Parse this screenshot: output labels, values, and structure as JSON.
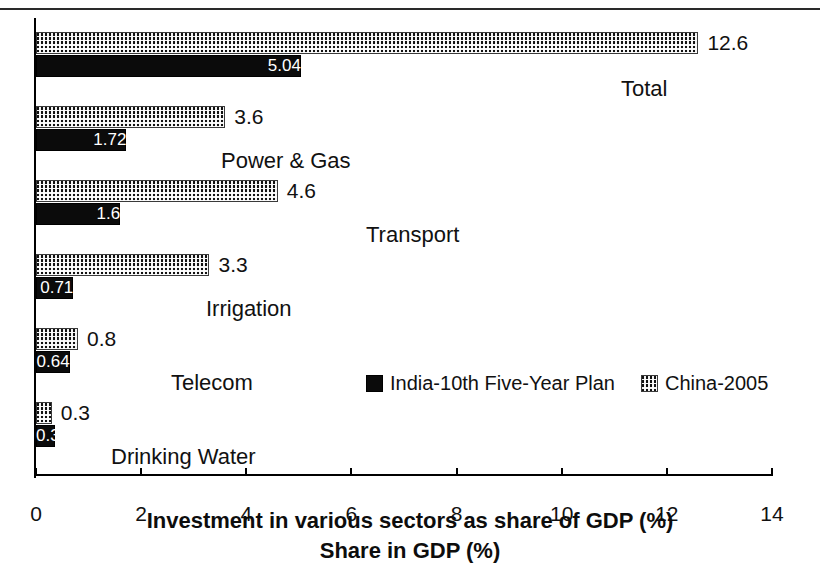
{
  "chart_data": {
    "type": "bar",
    "orientation": "horizontal",
    "title": "",
    "xlabel": "Investment in various sectors as share of GDP (%)",
    "xlabel_secondary": "Share in GDP (%)",
    "ylabel": "",
    "xlim": [
      0,
      14
    ],
    "xticks": [
      0,
      2,
      4,
      6,
      8,
      10,
      12,
      14
    ],
    "xtick_labels": [
      "0",
      "2",
      "4",
      "6",
      "8",
      "10",
      "12",
      "14"
    ],
    "grid": false,
    "legend_position": "inside-middle-right",
    "categories": [
      "Total",
      "Power & Gas",
      "Transport",
      "Irrigation",
      "Telecom",
      "Drinking Water"
    ],
    "series": [
      {
        "name": "India-10th Five-Year Plan",
        "fill": "solid-black",
        "color": "#0b0b0b",
        "values": [
          5.04,
          1.72,
          1.6,
          0.71,
          0.64,
          0.37
        ],
        "value_labels": [
          "5.04",
          "1.72",
          "1.6",
          "0.71",
          "0.64",
          "0.37"
        ],
        "label_position": "inside-end",
        "label_color": "#ffffff"
      },
      {
        "name": "China-2005",
        "fill": "checkered-mesh",
        "color": "#111111",
        "values": [
          12.6,
          3.6,
          4.6,
          3.3,
          0.8,
          0.3
        ],
        "value_labels": [
          "12.6",
          "3.6",
          "4.6",
          "3.3",
          "0.8",
          "0.3"
        ],
        "label_position": "outside-end",
        "label_color": "#111111"
      }
    ]
  },
  "axis": {
    "titles": {
      "primary": "Investment in various sectors as share of GDP (%)",
      "secondary": "Share in GDP (%)"
    },
    "ticks": [
      "0",
      "2",
      "4",
      "6",
      "8",
      "10",
      "12",
      "14"
    ]
  },
  "legend": {
    "items": [
      {
        "swatch": "solid-black-swatch",
        "label": "India-10th Five-Year Plan"
      },
      {
        "swatch": "checkered-swatch",
        "label": "China-2005"
      }
    ]
  },
  "groups": [
    {
      "category": "Total",
      "china_value_label": "12.6",
      "india_value_label": "5.04"
    },
    {
      "category": "Power & Gas",
      "china_value_label": "3.6",
      "india_value_label": "1.72"
    },
    {
      "category": "Transport",
      "china_value_label": "4.6",
      "india_value_label": "1.6"
    },
    {
      "category": "Irrigation",
      "china_value_label": "3.3",
      "india_value_label": "0.71"
    },
    {
      "category": "Telecom",
      "china_value_label": "0.8",
      "india_value_label": "0.64"
    },
    {
      "category": "Drinking Water",
      "china_value_label": "0.3",
      "india_value_label": "0.37"
    }
  ]
}
